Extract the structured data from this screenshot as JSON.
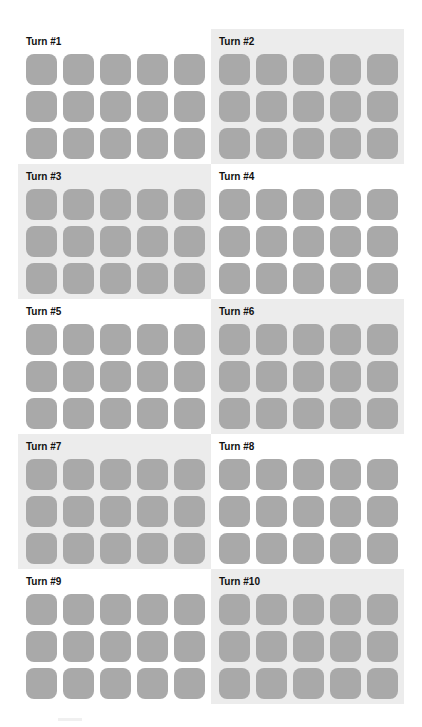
{
  "turns": [
    {
      "label": "Turn #1",
      "shaded": false
    },
    {
      "label": "Turn #2",
      "shaded": true
    },
    {
      "label": "Turn #3",
      "shaded": true
    },
    {
      "label": "Turn #4",
      "shaded": false
    },
    {
      "label": "Turn #5",
      "shaded": false
    },
    {
      "label": "Turn #6",
      "shaded": true
    },
    {
      "label": "Turn #7",
      "shaded": true
    },
    {
      "label": "Turn #8",
      "shaded": false
    },
    {
      "label": "Turn #9",
      "shaded": false
    },
    {
      "label": "Turn #10",
      "shaded": true
    }
  ],
  "grid": {
    "rows": 3,
    "cols": 5
  },
  "colors": {
    "tile": "#a9a9a9",
    "shaded_bg": "#ececec",
    "bg": "#ffffff"
  }
}
